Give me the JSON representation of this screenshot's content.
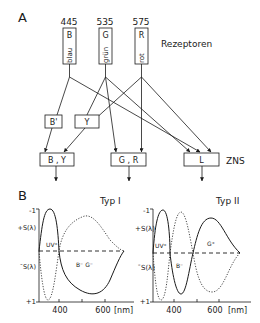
{
  "panel_a": {
    "label": "A",
    "receptors_label": "Rezeptoren",
    "zns_label": "ZNS",
    "receptors": [
      {
        "wavelength": "445",
        "letter": "B",
        "name": "blau"
      },
      {
        "wavelength": "535",
        "letter": "G",
        "name": "grün"
      },
      {
        "wavelength": "575",
        "letter": "R",
        "name": "rot"
      }
    ],
    "intermediate": [
      {
        "label": "B'"
      },
      {
        "label": "Y"
      }
    ],
    "outputs": [
      {
        "label": "B , Y"
      },
      {
        "label": "G , R"
      },
      {
        "label": "L"
      }
    ]
  },
  "panel_b": {
    "label": "B",
    "plots": [
      {
        "title": "Typ I",
        "y_top": "-1",
        "y_bottom": "+1",
        "y_label_plus": "+S(λ)",
        "y_label_minus": "¯S(λ)",
        "annotations": [
          "UV⁺",
          "B⁻ G⁻"
        ],
        "x_ticks": [
          "400",
          "600"
        ],
        "x_unit": "[nm]"
      },
      {
        "title": "Typ II",
        "y_top": "-1",
        "y_bottom": "+1",
        "y_label_plus": "+S(λ)",
        "y_label_minus": "¯S(λ)",
        "annotations": [
          "UV⁺",
          "B⁻",
          "G⁺"
        ],
        "x_ticks": [
          "400",
          "600"
        ],
        "x_unit": "[nm]"
      }
    ]
  }
}
